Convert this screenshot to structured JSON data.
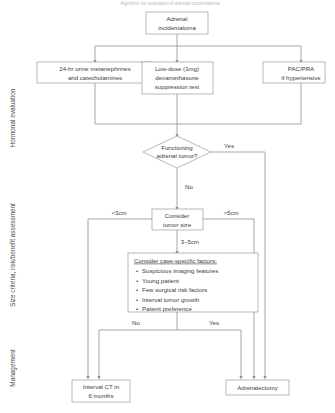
{
  "figure": {
    "header_caption": "Algorithm for evaluation of adrenal incidentaloma"
  },
  "swimlanes": [
    {
      "id": "hormonal",
      "label": "Hormonal evaluation"
    },
    {
      "id": "size",
      "label": "Size criteria, risk/benefit assessment"
    },
    {
      "id": "management",
      "label": "Management"
    }
  ],
  "nodes": {
    "start": {
      "name": "adrenal-incidentaloma",
      "lines": [
        "Adrenal",
        "incidentaloma"
      ]
    },
    "test_catecholamines": {
      "name": "urine-metanephrines-test",
      "lines": [
        "24-hr urine metanephrines",
        "and catecholamines"
      ]
    },
    "test_dexamethasone": {
      "name": "dexamethasone-suppression-test",
      "lines": [
        "Low-dose (1mg)",
        "dexamethasone",
        "suppression test"
      ]
    },
    "test_pac_pra": {
      "name": "pac-pra-test",
      "lines": [
        "PAC/PRA",
        "if hypertensive"
      ]
    },
    "decision_functioning": {
      "name": "functioning-tumor-decision",
      "lines": [
        "Functioning",
        "adrenal tumor?"
      ]
    },
    "tumor_size": {
      "name": "consider-tumor-size",
      "lines": [
        "Consider",
        "tumor size"
      ]
    },
    "case_factors": {
      "name": "case-specific-factors",
      "title": "Consider case-specific factors:",
      "items": [
        "Suspicious imaging features",
        "Young patient",
        "Few surgical risk factors",
        "Interval tumor growth",
        "Patient preference"
      ]
    },
    "interval_ct": {
      "name": "interval-ct-outcome",
      "lines": [
        "Interval CT in",
        "6 months"
      ]
    },
    "adrenalectomy": {
      "name": "adrenalectomy-outcome",
      "lines": [
        "Adrenalectomy"
      ]
    }
  },
  "edge_labels": {
    "functioning_yes": "Yes",
    "functioning_no": "No",
    "size_small": "<3cm",
    "size_large": ">5cm",
    "size_mid": "3–5cm",
    "factors_no": "No",
    "factors_yes": "Yes"
  },
  "colors": {
    "box_border": "#9a9a9a",
    "connector": "#8f8f8f",
    "text": "#3d3d3d",
    "background": "#ffffff"
  }
}
